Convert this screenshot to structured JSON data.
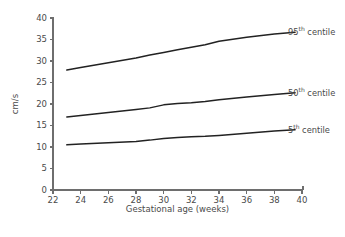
{
  "chart_data": {
    "type": "line",
    "title": "",
    "xlabel": "Gestational age (weeks)",
    "ylabel": "cm/s",
    "xlim": [
      22,
      40
    ],
    "ylim": [
      0,
      40
    ],
    "xticks": [
      22,
      24,
      26,
      28,
      30,
      32,
      34,
      36,
      38,
      40
    ],
    "yticks": [
      0,
      5,
      10,
      15,
      20,
      25,
      30,
      35,
      40
    ],
    "grid": false,
    "legend_position": "right-inline",
    "line_color": "#222222",
    "axis_color": "#6e6e6e",
    "x": [
      23,
      24,
      26,
      28,
      29,
      30,
      31,
      32,
      33,
      34,
      36,
      38,
      39.5
    ],
    "series": [
      {
        "name": "95th centile",
        "label_prefix": "95",
        "label_sup": "th",
        "label_suffix": " centile",
        "values": [
          27.9,
          28.5,
          29.6,
          30.7,
          31.4,
          32.0,
          32.6,
          33.2,
          33.8,
          34.6,
          35.5,
          36.3,
          36.7
        ]
      },
      {
        "name": "50th centile",
        "label_prefix": "50",
        "label_sup": "th",
        "label_suffix": " centile",
        "values": [
          17.0,
          17.3,
          18.0,
          18.7,
          19.1,
          19.8,
          20.1,
          20.3,
          20.6,
          21.0,
          21.6,
          22.2,
          22.6
        ]
      },
      {
        "name": "5th centile",
        "label_prefix": "5",
        "label_sup": "th",
        "label_suffix": " centile",
        "values": [
          10.5,
          10.7,
          11.0,
          11.3,
          11.6,
          12.0,
          12.2,
          12.4,
          12.5,
          12.7,
          13.2,
          13.7,
          14.0
        ]
      }
    ]
  },
  "axes": {
    "y_title": "cm/s",
    "x_title": "Gestational age (weeks)",
    "y_tick_labels": [
      "0",
      "5",
      "10",
      "15",
      "20",
      "25",
      "30",
      "35",
      "40"
    ],
    "x_tick_labels": [
      "22",
      "24",
      "26",
      "28",
      "30",
      "32",
      "34",
      "36",
      "38",
      "40"
    ]
  },
  "annotations": [
    {
      "id": "label-95",
      "prefix": "95",
      "sup": "th",
      "suffix": " centile"
    },
    {
      "id": "label-50",
      "prefix": "50",
      "sup": "th",
      "suffix": " centile"
    },
    {
      "id": "label-05",
      "prefix": "5",
      "sup": "th",
      "suffix": " centile"
    }
  ]
}
